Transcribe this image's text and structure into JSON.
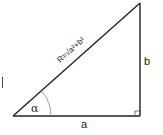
{
  "diagram": {
    "type": "right-triangle",
    "colors": {
      "stroke": "#222222",
      "arc": "#888888",
      "background": "#ffffff"
    },
    "vertices": {
      "bottom_left": [
        13,
        116
      ],
      "bottom_right": [
        140,
        116
      ],
      "top_right": [
        140,
        3
      ]
    },
    "labels": {
      "hypotenuse": "R=√a²+b²",
      "base": "a",
      "height": "b",
      "angle": "α"
    },
    "right_angle_marker": true
  }
}
